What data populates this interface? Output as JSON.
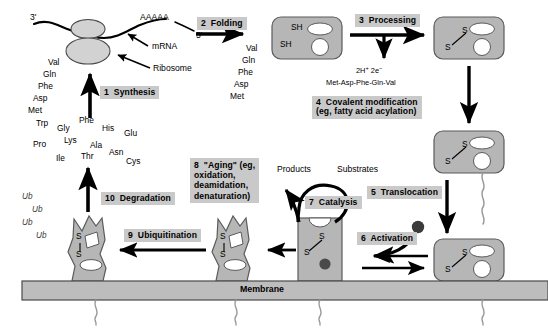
{
  "diagram": {
    "colors": {
      "protein_fill": "#b6b6b6",
      "protein_stroke": "#5a5a5a",
      "step_box_bg": "#c9c9c9",
      "membrane_fill": "#bdbdbd",
      "membrane_stroke": "#4a4a4a",
      "ligand_fill": "#555555",
      "cavity_fill": "#ffffff",
      "arrow": "#000000",
      "background": "#ffffff"
    }
  },
  "steps": {
    "synthesis": "1  Synthesis",
    "folding": "2  Folding",
    "processing": "3  Processing",
    "covalent_modification_line1": "4  Covalent modification",
    "covalent_modification_line2": "(eg, fatty acid acylation)",
    "translocation": "5  Translocation",
    "activation": "6  Activation",
    "catalysis": "7  Catalysis",
    "aging_line1": "8  \"Aging\" (eg,",
    "aging_line2": "oxidation,",
    "aging_line3": "deamidation,",
    "aging_line4": "denaturation)",
    "ubiquitination": "9  Ubiquitination",
    "degradation": "10  Degradation"
  },
  "synthesis_panel": {
    "three_prime": "3'",
    "five_prime": "5'",
    "poly_a": "AAAAA",
    "mrna_label": "mRNA",
    "ribosome_label": "Ribosome",
    "nascent_chain": [
      "Val",
      "Gln",
      "Phe",
      "Asp",
      "Met"
    ]
  },
  "folding_panel": {
    "nascent_chain": [
      "Val",
      "Gln",
      "Phe",
      "Asp",
      "Met"
    ]
  },
  "processing_panel": {
    "thiol_upper": "SH",
    "thiol_lower": "SH",
    "reductant": "2H",
    "reductant_sup1": "+",
    "reductant_2": "2e",
    "reductant_sup2": "−",
    "cleaved_peptide": "Met-Asp-Phe-Gln-Val"
  },
  "disulfide": {
    "s_left": "S",
    "s_right": "S"
  },
  "catalysis_panel": {
    "products": "Products",
    "substrates": "Substrates"
  },
  "degradation_panel": {
    "amino_acids": [
      "Trp",
      "Gly",
      "Phe",
      "His",
      "Glu",
      "Pro",
      "Lys",
      "Ala",
      "Ile",
      "Thr",
      "Asn",
      "Cys"
    ],
    "ubiquitin_tags": [
      "Ub",
      "Ub",
      "Ub",
      "Ub"
    ]
  },
  "membrane": {
    "label": "Membrane"
  }
}
